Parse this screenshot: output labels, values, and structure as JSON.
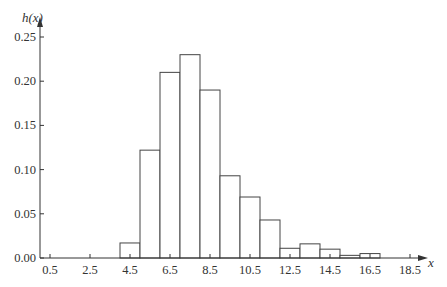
{
  "chart_data": {
    "type": "bar",
    "title": "",
    "xlabel": "x",
    "ylabel": "h(x)",
    "ylim": [
      0,
      0.25
    ],
    "xlim": [
      0,
      19
    ],
    "grid": false,
    "legend": null,
    "bin_width": 1,
    "categories": [
      "4.5",
      "5.5",
      "6.5",
      "7.5",
      "8.5",
      "9.5",
      "10.5",
      "11.5",
      "12.5",
      "13.5",
      "14.5",
      "15.5",
      "16.5"
    ],
    "x": [
      4.5,
      5.5,
      6.5,
      7.5,
      8.5,
      9.5,
      10.5,
      11.5,
      12.5,
      13.5,
      14.5,
      15.5,
      16.5
    ],
    "values": [
      0.017,
      0.122,
      0.21,
      0.23,
      0.19,
      0.093,
      0.069,
      0.043,
      0.011,
      0.016,
      0.01,
      0.003,
      0.005
    ],
    "x_ticks": [
      0.5,
      2.5,
      4.5,
      6.5,
      8.5,
      10.5,
      12.5,
      14.5,
      16.5,
      18.5
    ],
    "x_tick_labels": [
      "0.5",
      "2.5",
      "4.5",
      "6.5",
      "8.5",
      "10.5",
      "12.5",
      "14.5",
      "16.5",
      "18.5"
    ],
    "y_ticks": [
      0,
      0.05,
      0.1,
      0.15,
      0.2,
      0.25
    ],
    "y_tick_labels": [
      "0.00",
      "0.05",
      "0.10",
      "0.15",
      "0.20",
      "0.25"
    ]
  },
  "colors": {
    "axis": "#333333",
    "bar_fill": "#ffffff",
    "bar_stroke": "#444444"
  }
}
